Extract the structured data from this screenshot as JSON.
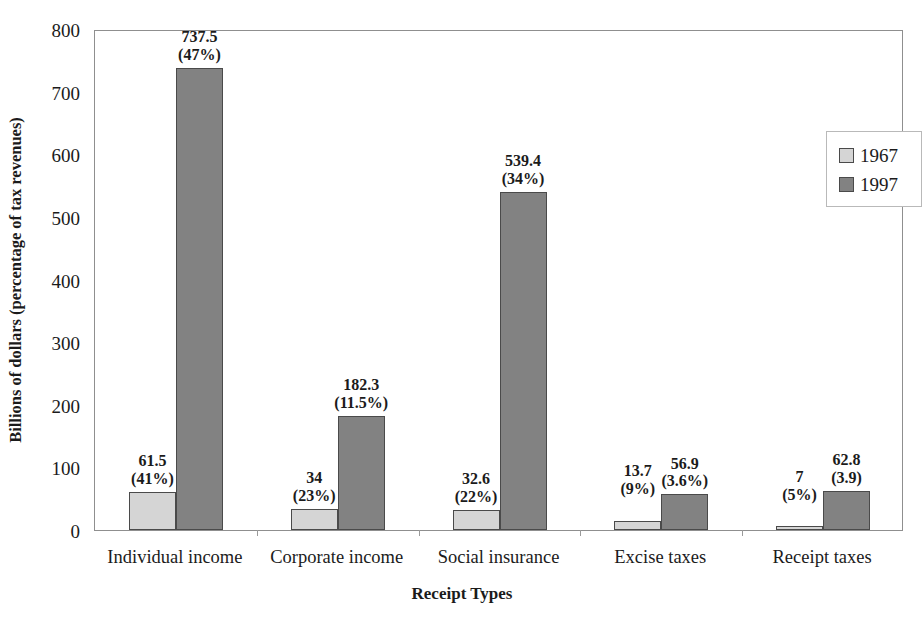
{
  "chart_data": {
    "type": "bar",
    "title": "",
    "xlabel": "Receipt Types",
    "ylabel": "Billions of dollars (percentage of tax revenues)",
    "ylim": [
      0,
      800
    ],
    "yticks": [
      0,
      100,
      200,
      300,
      400,
      500,
      600,
      700,
      800
    ],
    "ytick_labels": [
      "0",
      "100",
      "200",
      "300",
      "400",
      "500",
      "600",
      "700",
      "800"
    ],
    "grid": false,
    "legend_position": "top-right",
    "categories": [
      "Individual income",
      "Corporate income",
      "Social insurance",
      "Excise taxes",
      "Receipt taxes"
    ],
    "series": [
      {
        "name": "1967",
        "color": "#d5d5d5",
        "values": [
          61.5,
          34,
          32.6,
          13.7,
          7
        ],
        "percent_labels": [
          "(41%)",
          "(23%)",
          "(22%)",
          "(9%)",
          "(5%)"
        ],
        "value_labels": [
          "61.5",
          "34",
          "32.6",
          "13.7",
          "7"
        ]
      },
      {
        "name": "1997",
        "color": "#828282",
        "values": [
          737.5,
          182.3,
          539.4,
          56.9,
          62.8
        ],
        "percent_labels": [
          "(47%)",
          "(11.5%)",
          "(34%)",
          "(3.6%)",
          "(3.9)"
        ],
        "value_labels": [
          "737.5",
          "182.3",
          "539.4",
          "56.9",
          "62.8"
        ]
      }
    ]
  },
  "legend": {
    "items": [
      {
        "label": "1967",
        "swatch": "light-gray"
      },
      {
        "label": "1997",
        "swatch": "dark-gray"
      }
    ]
  },
  "axes": {
    "y_title": "Billions of dollars (percentage of tax revenues)",
    "x_title": "Receipt Types"
  }
}
